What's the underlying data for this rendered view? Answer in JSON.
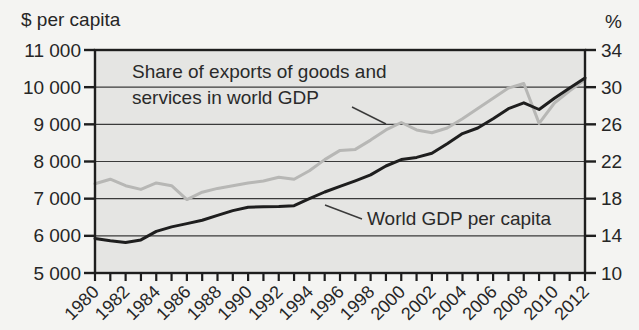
{
  "chart_data": {
    "type": "line",
    "x": [
      1980,
      1981,
      1982,
      1983,
      1984,
      1985,
      1986,
      1987,
      1988,
      1989,
      1990,
      1991,
      1992,
      1993,
      1994,
      1995,
      1996,
      1997,
      1998,
      1999,
      2000,
      2001,
      2002,
      2003,
      2004,
      2005,
      2006,
      2007,
      2008,
      2009,
      2010,
      2011,
      2012
    ],
    "x_labeled_ticks": [
      1980,
      1982,
      1984,
      1986,
      1988,
      1990,
      1992,
      1994,
      1996,
      1998,
      2000,
      2002,
      2004,
      2006,
      2008,
      2010,
      2012
    ],
    "series": [
      {
        "name": "Share of exports of goods and services in world GDP",
        "axis": "right",
        "color": "#b7b7b5",
        "values": [
          19.6,
          20.1,
          19.4,
          19.0,
          19.7,
          19.4,
          17.9,
          18.7,
          19.1,
          19.4,
          19.7,
          19.9,
          20.3,
          20.1,
          21.0,
          22.2,
          23.2,
          23.3,
          24.3,
          25.4,
          26.2,
          25.4,
          25.1,
          25.6,
          26.6,
          27.7,
          28.8,
          29.9,
          30.4,
          26.1,
          28.3,
          29.6,
          30.8
        ]
      },
      {
        "name": "World GDP per capita",
        "axis": "left",
        "color": "#1e1e1e",
        "values": [
          5930,
          5870,
          5820,
          5890,
          6120,
          6240,
          6330,
          6420,
          6550,
          6680,
          6770,
          6780,
          6790,
          6810,
          7000,
          7180,
          7330,
          7480,
          7640,
          7880,
          8050,
          8110,
          8220,
          8480,
          8750,
          8900,
          9150,
          9420,
          9580,
          9400,
          9700,
          9980,
          10250
        ]
      }
    ],
    "left_axis": {
      "label": "$ per capita",
      "min": 5000,
      "max": 11000,
      "tick_values": [
        11000,
        10000,
        9000,
        8000,
        7000,
        6000,
        5000
      ],
      "tick_labels": [
        "11 000",
        "10 000",
        "9 000",
        "8 000",
        "7 000",
        "6 000",
        "5 000"
      ]
    },
    "right_axis": {
      "label": "%",
      "min": 10,
      "max": 34,
      "tick_values": [
        34,
        30,
        26,
        22,
        18,
        14,
        10
      ],
      "tick_labels": [
        "34",
        "30",
        "26",
        "22",
        "18",
        "14",
        "10"
      ]
    },
    "grid": true,
    "legend_position": "none",
    "annotations": {
      "exports_label": {
        "line1": "Share of exports of goods and",
        "line2": "services in world GDP",
        "callout": {
          "x1": 352,
          "y1": 107,
          "x2": 386,
          "y2": 124
        }
      },
      "gdp_label": {
        "text": "World GDP per capita",
        "callout": {
          "x1": 362,
          "y1": 219,
          "x2": 325,
          "y2": 205
        }
      }
    },
    "colors": {
      "page_bg": "#f4f4f2",
      "plot_bg": "#e5e5e3",
      "grid": "#3a3a3a",
      "frame": "#1e1e1e",
      "text": "#262626"
    }
  }
}
